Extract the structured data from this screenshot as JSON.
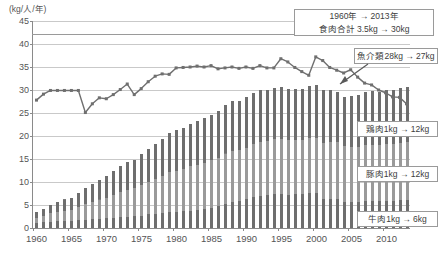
{
  "chart_data": {
    "type": "bar",
    "title": "",
    "subtitle": "",
    "ylabel": "(kg/人/年)",
    "xlabel": "",
    "ylim": [
      0,
      45
    ],
    "ytick_values": [
      0,
      5,
      10,
      15,
      20,
      25,
      30,
      35,
      40,
      45
    ],
    "ytick_labels": [
      "0",
      "5",
      "10",
      "15",
      "20",
      "25",
      "30",
      "35",
      "40",
      "45"
    ],
    "grid": true,
    "legend_position": "none",
    "x": [
      1960,
      1961,
      1962,
      1963,
      1964,
      1965,
      1966,
      1967,
      1968,
      1969,
      1970,
      1971,
      1972,
      1973,
      1974,
      1975,
      1976,
      1977,
      1978,
      1979,
      1980,
      1981,
      1982,
      1983,
      1984,
      1985,
      1986,
      1987,
      1988,
      1989,
      1990,
      1991,
      1992,
      1993,
      1994,
      1995,
      1996,
      1997,
      1998,
      1999,
      2000,
      2001,
      2002,
      2003,
      2004,
      2005,
      2006,
      2007,
      2008,
      2009,
      2010,
      2011,
      2012,
      2013
    ],
    "xtick_labels": [
      "1960",
      "1965",
      "1970",
      "1975",
      "1980",
      "1985",
      "1990",
      "1995",
      "2000",
      "2005",
      "2010"
    ],
    "xtick_values": [
      1960,
      1965,
      1970,
      1975,
      1980,
      1985,
      1990,
      1995,
      2000,
      2005,
      2010
    ],
    "series": [
      {
        "name": "魚介類",
        "type": "line",
        "color": "#6f6f6f",
        "values": [
          27.8,
          29.1,
          29.9,
          29.9,
          29.9,
          29.9,
          29.9,
          25.1,
          27.0,
          28.3,
          28.1,
          29.0,
          30.1,
          31.3,
          29.0,
          30.3,
          31.8,
          33.0,
          33.5,
          33.4,
          34.8,
          34.9,
          35.0,
          35.2,
          35.0,
          35.3,
          34.6,
          34.8,
          35.0,
          34.7,
          35.0,
          34.7,
          35.3,
          34.8,
          34.8,
          36.8,
          36.1,
          34.9,
          34.0,
          33.2,
          37.2,
          36.4,
          34.9,
          34.3,
          33.7,
          34.4,
          32.8,
          31.5,
          31.1,
          30.0,
          29.4,
          28.5,
          28.4,
          27.0
        ]
      },
      {
        "name": "牛肉",
        "type": "bar-segment",
        "color": "#6e6e6e",
        "values": [
          1.1,
          1.2,
          1.4,
          1.5,
          1.6,
          1.5,
          1.7,
          1.8,
          1.9,
          2.0,
          2.1,
          2.2,
          2.4,
          2.5,
          2.6,
          2.7,
          3.0,
          3.1,
          3.3,
          3.5,
          3.5,
          3.6,
          3.8,
          4.0,
          4.2,
          4.4,
          4.7,
          5.2,
          5.6,
          5.8,
          6.2,
          6.8,
          7.0,
          7.2,
          7.5,
          7.5,
          7.2,
          7.4,
          7.3,
          7.6,
          7.6,
          6.4,
          6.4,
          6.4,
          5.7,
          5.6,
          5.7,
          5.9,
          5.9,
          5.8,
          5.9,
          5.9,
          6.0,
          6.0
        ]
      },
      {
        "name": "豚肉",
        "type": "bar-segment",
        "color": "#9a9a9a",
        "values": [
          1.1,
          1.4,
          1.8,
          2.0,
          2.2,
          2.4,
          2.9,
          3.4,
          3.8,
          4.2,
          4.5,
          5.0,
          5.5,
          5.8,
          6.0,
          6.6,
          7.0,
          7.5,
          8.0,
          8.6,
          9.0,
          9.2,
          9.6,
          9.8,
          10.0,
          10.3,
          10.6,
          11.0,
          11.2,
          11.1,
          11.3,
          11.5,
          11.7,
          11.7,
          11.8,
          11.8,
          11.9,
          11.8,
          11.8,
          11.9,
          11.9,
          12.1,
          12.3,
          12.2,
          12.1,
          12.0,
          12.0,
          12.1,
          12.2,
          12.2,
          12.3,
          12.4,
          12.5,
          12.6
        ]
      },
      {
        "name": "鶏肉",
        "type": "bar-segment",
        "color": "#6e6e6e",
        "values": [
          1.3,
          1.5,
          1.8,
          2.1,
          2.4,
          2.7,
          3.1,
          3.5,
          3.9,
          4.3,
          4.7,
          5.1,
          5.6,
          6.0,
          6.2,
          6.7,
          7.1,
          7.6,
          8.0,
          8.5,
          8.8,
          9.0,
          9.3,
          9.5,
          9.7,
          9.9,
          10.2,
          10.6,
          10.8,
          10.8,
          11.0,
          11.1,
          11.2,
          11.1,
          11.2,
          11.3,
          11.2,
          11.1,
          11.2,
          11.4,
          11.5,
          11.4,
          11.3,
          11.0,
          10.7,
          11.0,
          11.3,
          11.5,
          11.6,
          11.6,
          11.7,
          11.8,
          11.9,
          12.0
        ]
      }
    ],
    "bar_totals": [
      3.5,
      4.1,
      5.0,
      5.6,
      6.2,
      6.6,
      7.7,
      8.7,
      9.6,
      10.5,
      11.3,
      12.3,
      13.5,
      14.3,
      14.8,
      16.0,
      17.1,
      18.2,
      19.3,
      20.6,
      21.3,
      21.8,
      22.7,
      23.3,
      23.9,
      24.6,
      25.5,
      26.8,
      27.6,
      27.7,
      28.5,
      29.4,
      29.9,
      30.0,
      30.5,
      30.6,
      30.3,
      30.3,
      30.3,
      30.9,
      31.0,
      29.9,
      30.0,
      29.6,
      28.5,
      28.6,
      29.0,
      29.5,
      29.7,
      29.6,
      29.9,
      30.1,
      30.4,
      30.6
    ]
  },
  "annotations": {
    "total_meat": {
      "line1": "1960年 → 2013年",
      "line2": "食肉合計 3.5kg → 30kg"
    },
    "seafood": {
      "line1": "魚介類28kg → 27kg"
    },
    "chicken": {
      "line1": "鶏肉1kg → 12kg"
    },
    "pork": {
      "line1": "豚肉1kg → 12kg"
    },
    "beef": {
      "line1": "牛肉1kg → 6kg"
    }
  },
  "caption": ""
}
